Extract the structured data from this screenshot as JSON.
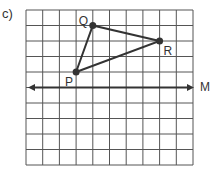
{
  "part_label": "c)",
  "grid": {
    "columns": 10,
    "rows": 10,
    "origin_px": [
      26,
      10
    ],
    "cell_w": 16.7,
    "cell_h": 15.5,
    "line_color": "#555555"
  },
  "triangle": {
    "stroke_color": "#333333",
    "vertices": [
      {
        "name": "P",
        "col": 3,
        "row": 4,
        "label": "P",
        "label_offset": [
          -11,
          4
        ]
      },
      {
        "name": "Q",
        "col": 4,
        "row": 1,
        "label": "Q",
        "label_offset": [
          -14,
          -11
        ]
      },
      {
        "name": "R",
        "col": 8,
        "row": 2,
        "label": "R",
        "label_offset": [
          4,
          4
        ]
      }
    ]
  },
  "mirror_line": {
    "label": "M",
    "row": 5,
    "x_start": 28,
    "x_end": 194,
    "arrows": "both"
  },
  "labels": {
    "P": "P",
    "Q": "Q",
    "R": "R",
    "M": "M"
  }
}
